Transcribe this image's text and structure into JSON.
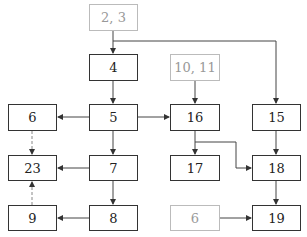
{
  "diagram": {
    "nodes": [
      {
        "id": "n2_3",
        "label": "2, 3",
        "style": "ghost",
        "x": 89,
        "y": 4,
        "w": 49,
        "h": 27
      },
      {
        "id": "n4",
        "label": "4",
        "style": "solid",
        "x": 89,
        "y": 54,
        "w": 49,
        "h": 27
      },
      {
        "id": "n10_11",
        "label": "10, 11",
        "style": "ghost",
        "x": 170,
        "y": 54,
        "w": 50,
        "h": 27
      },
      {
        "id": "n6a",
        "label": "6",
        "style": "solid",
        "x": 8,
        "y": 104,
        "w": 49,
        "h": 27
      },
      {
        "id": "n5",
        "label": "5",
        "style": "solid",
        "x": 89,
        "y": 104,
        "w": 49,
        "h": 27
      },
      {
        "id": "n16",
        "label": "16",
        "style": "solid",
        "x": 170,
        "y": 104,
        "w": 50,
        "h": 27
      },
      {
        "id": "n15",
        "label": "15",
        "style": "solid",
        "x": 252,
        "y": 104,
        "w": 49,
        "h": 27
      },
      {
        "id": "n23",
        "label": "23",
        "style": "solid",
        "x": 8,
        "y": 155,
        "w": 49,
        "h": 26
      },
      {
        "id": "n7",
        "label": "7",
        "style": "solid",
        "x": 89,
        "y": 155,
        "w": 49,
        "h": 26
      },
      {
        "id": "n17",
        "label": "17",
        "style": "solid",
        "x": 170,
        "y": 155,
        "w": 50,
        "h": 26
      },
      {
        "id": "n18",
        "label": "18",
        "style": "solid",
        "x": 252,
        "y": 155,
        "w": 49,
        "h": 26
      },
      {
        "id": "n9",
        "label": "9",
        "style": "solid",
        "x": 8,
        "y": 205,
        "w": 49,
        "h": 26
      },
      {
        "id": "n8",
        "label": "8",
        "style": "solid",
        "x": 89,
        "y": 205,
        "w": 49,
        "h": 26
      },
      {
        "id": "n6b",
        "label": "6",
        "style": "ghost",
        "x": 170,
        "y": 205,
        "w": 50,
        "h": 26
      },
      {
        "id": "n19",
        "label": "19",
        "style": "solid",
        "x": 252,
        "y": 205,
        "w": 49,
        "h": 26
      }
    ],
    "edges": [
      {
        "from": "2, 3",
        "to": "4",
        "style": "solid"
      },
      {
        "from": "2, 3",
        "to": "15",
        "style": "solid"
      },
      {
        "from": "4",
        "to": "5",
        "style": "solid"
      },
      {
        "from": "5",
        "to": "6",
        "style": "solid"
      },
      {
        "from": "5",
        "to": "16",
        "style": "solid"
      },
      {
        "from": "5",
        "to": "7",
        "style": "solid"
      },
      {
        "from": "10, 11",
        "to": "16",
        "style": "solid"
      },
      {
        "from": "16",
        "to": "17",
        "style": "solid"
      },
      {
        "from": "16",
        "to": "18",
        "style": "solid"
      },
      {
        "from": "15",
        "to": "18",
        "style": "solid"
      },
      {
        "from": "18",
        "to": "19",
        "style": "solid"
      },
      {
        "from": "6",
        "to": "19",
        "style": "solid"
      },
      {
        "from": "7",
        "to": "23",
        "style": "solid"
      },
      {
        "from": "7",
        "to": "8",
        "style": "solid"
      },
      {
        "from": "8",
        "to": "9",
        "style": "solid"
      },
      {
        "from": "6",
        "to": "23",
        "style": "dashed"
      },
      {
        "from": "9",
        "to": "23",
        "style": "dashed"
      }
    ]
  },
  "labels": {
    "n2_3": "2, 3",
    "n4": "4",
    "n10_11": "10, 11",
    "n6a": "6",
    "n5": "5",
    "n16": "16",
    "n15": "15",
    "n23": "23",
    "n7": "7",
    "n17": "17",
    "n18": "18",
    "n9": "9",
    "n8": "8",
    "n6b": "6",
    "n19": "19"
  }
}
